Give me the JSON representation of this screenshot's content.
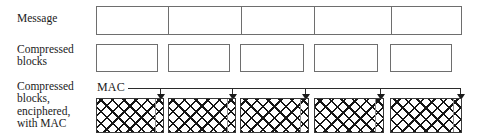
{
  "diagram": {
    "colors": {
      "box_border": "#6e6e6e",
      "hatch_border": "#3a3a3a",
      "hatch_line": "#151515",
      "arrow": "#1a1a1a",
      "text": "#1a1a1a",
      "background": "#ffffff"
    },
    "rows": [
      {
        "id": "message",
        "label": "Message",
        "type": "contiguous-strip",
        "segment_count": 5
      },
      {
        "id": "compressed",
        "label": "Compressed\nblocks",
        "type": "separate-boxes",
        "block_count": 5
      },
      {
        "id": "enciphered",
        "label": "Compressed\nblocks,\nenciphered,\nwith MAC",
        "type": "hatched-boxes",
        "block_count": 5,
        "fill": "cross-hatch"
      }
    ],
    "mac": {
      "label": "MAC",
      "arrow_count": 5,
      "description": "MAC appended to the end of each enciphered block"
    },
    "message_segments": [
      {
        "index": 1,
        "left": 96,
        "width": 71
      },
      {
        "index": 2,
        "left": 167,
        "width": 73
      },
      {
        "index": 3,
        "left": 240,
        "width": 73
      },
      {
        "index": 4,
        "left": 313,
        "width": 77
      },
      {
        "index": 5,
        "left": 390,
        "width": 72
      }
    ],
    "compressed_blocks": [
      {
        "index": 1,
        "left": 96,
        "width": 62
      },
      {
        "index": 2,
        "left": 168,
        "width": 62
      },
      {
        "index": 3,
        "left": 240,
        "width": 64
      },
      {
        "index": 4,
        "left": 314,
        "width": 64
      },
      {
        "index": 5,
        "left": 390,
        "width": 62
      }
    ],
    "enciphered_blocks": [
      {
        "index": 1,
        "left": 96,
        "width": 68,
        "mac_sep_offset": 58
      },
      {
        "index": 2,
        "left": 168,
        "width": 68,
        "mac_sep_offset": 58
      },
      {
        "index": 3,
        "left": 240,
        "width": 69,
        "mac_sep_offset": 59
      },
      {
        "index": 4,
        "left": 314,
        "width": 70,
        "mac_sep_offset": 60
      },
      {
        "index": 5,
        "left": 390,
        "width": 72,
        "mac_sep_offset": 62
      }
    ],
    "mac_arrows": [
      {
        "index": 1,
        "x": 160
      },
      {
        "index": 2,
        "x": 232
      },
      {
        "index": 3,
        "x": 305
      },
      {
        "index": 4,
        "x": 380
      },
      {
        "index": 5,
        "x": 460
      }
    ]
  }
}
